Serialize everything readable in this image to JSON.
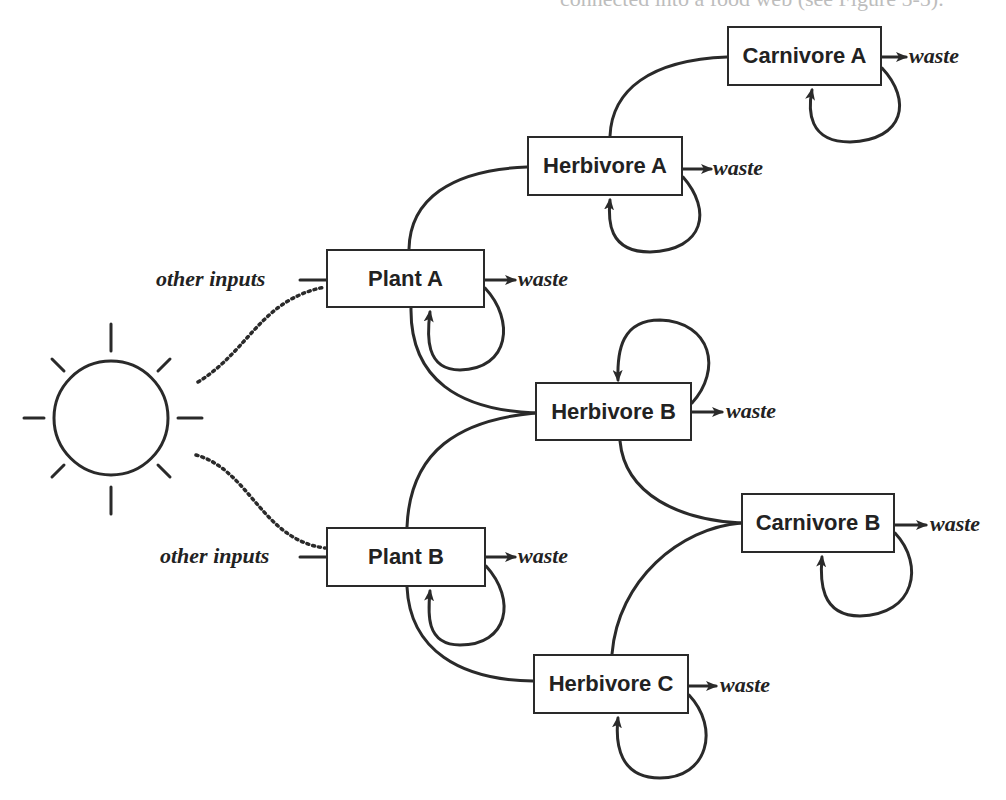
{
  "page": {
    "cut_off_text": "connected into a food web (see Figure 5-5)."
  },
  "diagram": {
    "type": "food-web",
    "energy_source": {
      "name": "Sun",
      "icon": "sun-icon"
    },
    "nodes": {
      "carnivore_a": {
        "label": "Carnivore A",
        "waste": "waste"
      },
      "herbivore_a": {
        "label": "Herbivore A",
        "waste": "waste"
      },
      "plant_a": {
        "label": "Plant A",
        "waste": "waste",
        "input": "other inputs"
      },
      "herbivore_b": {
        "label": "Herbivore B",
        "waste": "waste"
      },
      "carnivore_b": {
        "label": "Carnivore B",
        "waste": "waste"
      },
      "plant_b": {
        "label": "Plant B",
        "waste": "waste",
        "input": "other inputs"
      },
      "herbivore_c": {
        "label": "Herbivore C",
        "waste": "waste"
      }
    },
    "edges": [
      {
        "from": "Sun",
        "to": "Plant A",
        "style": "dotted"
      },
      {
        "from": "Sun",
        "to": "Plant B",
        "style": "dotted"
      },
      {
        "from": "Plant A",
        "to": "Herbivore A"
      },
      {
        "from": "Plant A",
        "to": "Herbivore B"
      },
      {
        "from": "Plant B",
        "to": "Herbivore B"
      },
      {
        "from": "Plant B",
        "to": "Herbivore C"
      },
      {
        "from": "Herbivore A",
        "to": "Carnivore A"
      },
      {
        "from": "Herbivore B",
        "to": "Carnivore B"
      },
      {
        "from": "Herbivore C",
        "to": "Carnivore B"
      }
    ],
    "self_loops": [
      "Carnivore A",
      "Herbivore A",
      "Plant A",
      "Herbivore B",
      "Carnivore B",
      "Plant B",
      "Herbivore C"
    ],
    "colors": {
      "line": "#2a2a2a",
      "background": "#ffffff"
    }
  }
}
